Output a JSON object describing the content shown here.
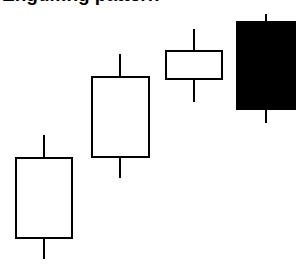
{
  "title": "Engulfing pattern",
  "chart_data": {
    "type": "candlestick",
    "xlabel": "",
    "ylabel": "",
    "grid": false,
    "legend": null,
    "axes_visible": false,
    "candles": [
      {
        "index": 1,
        "direction": "up",
        "fill": "#ffffff",
        "high": 135,
        "open_close_top": 158,
        "open_close_bottom": 238,
        "low": 259,
        "x_center": 44,
        "x_left": 16,
        "x_right": 72
      },
      {
        "index": 2,
        "direction": "up",
        "fill": "#ffffff",
        "high": 54,
        "open_close_top": 77,
        "open_close_bottom": 157,
        "low": 178,
        "x_center": 120,
        "x_left": 92,
        "x_right": 149
      },
      {
        "index": 3,
        "direction": "up",
        "fill": "#ffffff",
        "high": 29,
        "open_close_top": 51,
        "open_close_bottom": 79,
        "low": 102,
        "x_center": 194,
        "x_left": 166,
        "x_right": 222
      },
      {
        "index": 4,
        "direction": "down",
        "fill": "#000000",
        "high": 14,
        "open_close_top": 22,
        "open_close_bottom": 109,
        "low": 123,
        "x_center": 266,
        "x_left": 237,
        "x_right": 295
      }
    ],
    "relative_values_note": "Pixel y-coordinates (smaller = higher price). Approximate prices on 0-100 scale below.",
    "series": [
      {
        "name": "open",
        "values": [
          15,
          44,
          79,
          97
        ]
      },
      {
        "name": "high",
        "values": [
          54,
          84,
          93,
          100
        ]
      },
      {
        "name": "low",
        "values": [
          6,
          37,
          70,
          73
        ]
      },
      {
        "name": "close",
        "values": [
          44,
          79,
          90,
          66
        ]
      }
    ],
    "categories": [
      "1",
      "2",
      "3",
      "4"
    ],
    "colors": {
      "stroke": "#000000",
      "bullish_fill": "#ffffff",
      "bearish_fill": "#000000"
    }
  }
}
